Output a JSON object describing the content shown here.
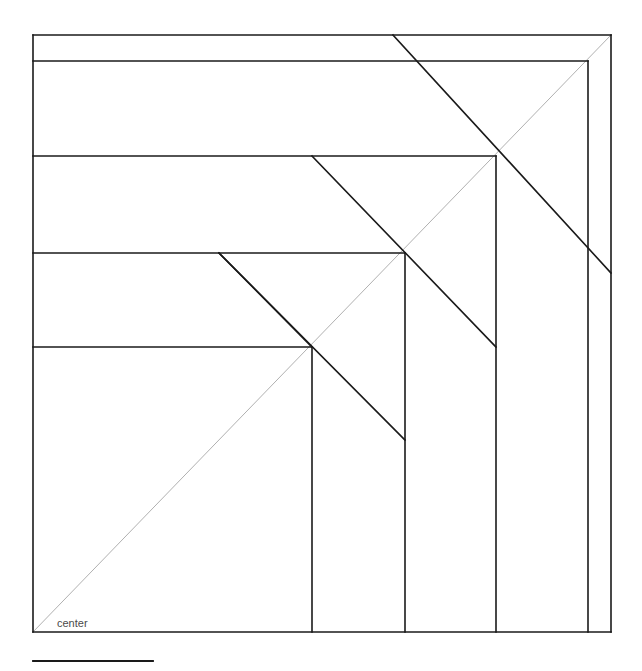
{
  "figure": {
    "canvas": {
      "width": 642,
      "height": 671
    },
    "colors": {
      "background": "#ffffff",
      "stroke": "#1a1a1a",
      "diagonal_guide": "#b0b0b0",
      "label": "#4a4a4a"
    },
    "stroke_widths": {
      "main": 1.6,
      "guide": 1.0,
      "rule": 1.8
    },
    "labels": [
      {
        "name": "center",
        "text": "center",
        "x": 57,
        "y": 627
      }
    ],
    "outer_square": {
      "x": 33,
      "y": 35,
      "width": 578,
      "height": 597
    },
    "guide_diagonal": {
      "x1": 33,
      "y1": 632,
      "x2": 611,
      "y2": 35
    },
    "horizontal_lines": [
      {
        "name": "top-edge",
        "x1": 33,
        "y1": 35,
        "x2": 611,
        "y2": 35
      },
      {
        "name": "band-1",
        "x1": 33,
        "y1": 61,
        "x2": 588,
        "y2": 61
      },
      {
        "name": "band-2",
        "x1": 33,
        "y1": 156,
        "x2": 496,
        "y2": 156
      },
      {
        "name": "band-3",
        "x1": 33,
        "y1": 253,
        "x2": 405,
        "y2": 253
      },
      {
        "name": "band-4",
        "x1": 33,
        "y1": 347,
        "x2": 312,
        "y2": 347
      },
      {
        "name": "bottom-edge",
        "x1": 33,
        "y1": 632,
        "x2": 611,
        "y2": 632
      }
    ],
    "vertical_lines": [
      {
        "name": "left-edge",
        "x1": 33,
        "y1": 35,
        "x2": 33,
        "y2": 632
      },
      {
        "name": "right-edge",
        "x1": 611,
        "y1": 35,
        "x2": 611,
        "y2": 632
      },
      {
        "name": "rib-1",
        "x1": 588,
        "y1": 61,
        "x2": 588,
        "y2": 632
      },
      {
        "name": "rib-2",
        "x1": 496,
        "y1": 156,
        "x2": 496,
        "y2": 632
      },
      {
        "name": "rib-3",
        "x1": 405,
        "y1": 253,
        "x2": 405,
        "y2": 632
      },
      {
        "name": "rib-4",
        "x1": 312,
        "y1": 347,
        "x2": 312,
        "y2": 632
      }
    ],
    "diagonal_lines": [
      {
        "name": "fold-1",
        "x1": 393,
        "y1": 35,
        "x2": 611,
        "y2": 273
      },
      {
        "name": "fold-2",
        "x1": 312,
        "y1": 156,
        "x2": 496,
        "y2": 347
      },
      {
        "name": "fold-3",
        "x1": 219,
        "y1": 253,
        "x2": 405,
        "y2": 440
      },
      {
        "name": "fold-4",
        "x1": 219,
        "y1": 253,
        "x2": 312,
        "y2": 347
      }
    ],
    "rule_line": {
      "name": "bottom-rule",
      "x1": 33,
      "y1": 661,
      "x2": 153,
      "y2": 661
    }
  }
}
